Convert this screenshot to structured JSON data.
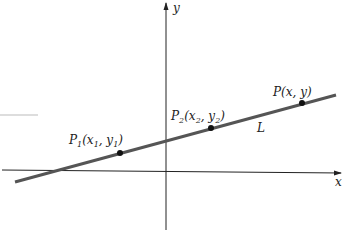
{
  "diagram": {
    "axes": {
      "x_label": "x",
      "y_label": "y"
    },
    "line_label": "L",
    "points": [
      {
        "name": "P",
        "sub": "1",
        "coords_open": "(x",
        "xsub": "1",
        "sep": ", y",
        "ysub": "1",
        "close": ")"
      },
      {
        "name": "P",
        "sub": "2",
        "coords_open": "(x",
        "xsub": "2",
        "sep": ", y",
        "ysub": "2",
        "close": ")"
      },
      {
        "name": "P(x, y)"
      }
    ],
    "colors": {
      "line": "#555555",
      "axis": "#222222",
      "point": "#111111"
    }
  }
}
